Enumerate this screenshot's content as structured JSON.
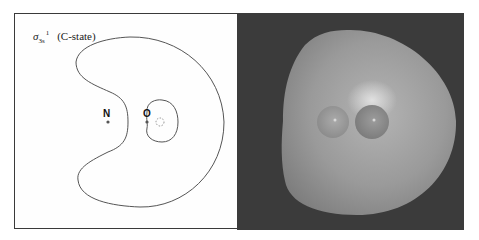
{
  "figure": {
    "left_panel": {
      "title": {
        "symbol": "σ",
        "subscript": "3s",
        "superscript": "1",
        "state": "(C-state)"
      },
      "atoms": [
        {
          "label": "N",
          "x": 108,
          "y": 122
        },
        {
          "label": "O",
          "x": 147,
          "y": 122
        }
      ],
      "contour_color": "#555555",
      "dashed_contour_color": "#777777"
    },
    "right_panel": {
      "background_color": "#3b3b3b",
      "surface_color": "#9a9a9a",
      "description": "3D isosurface rendering with two atom spheres"
    }
  }
}
